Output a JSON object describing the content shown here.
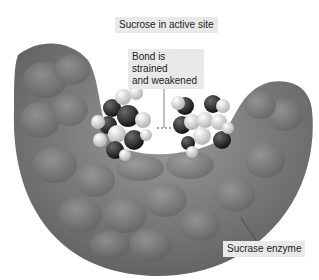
{
  "labels": {
    "active_site": "Sucrose in active site",
    "bond_line1": "Bond is strained",
    "bond_line2": "and weakened",
    "enzyme": "Sucrase enzyme"
  },
  "colors": {
    "enzyme": "#7a7a7a",
    "atom_dark": "#2a2a2a",
    "atom_light": "#e4e4e4",
    "label_bg": "#e9e9e9"
  }
}
